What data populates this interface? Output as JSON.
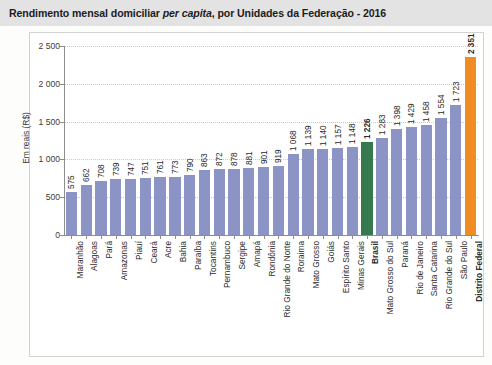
{
  "title": {
    "before_italic": "Rendimento mensal domiciliar ",
    "italic": "per capita",
    "after_italic": ", por Unidades da Federação - 2016"
  },
  "colors": {
    "bar_default": "#8b94c4",
    "bar_brasil": "#36794e",
    "bar_distrito_federal": "#ef8c24",
    "title_band": "#e3e3e3",
    "grid": "#c9c9c9",
    "axis": "#8d8d8d"
  },
  "chart_data": {
    "type": "bar",
    "title": "Rendimento mensal domiciliar per capita, por Unidades da Federação - 2016",
    "xlabel": "",
    "ylabel": "Em reais (R$)",
    "ylim": [
      0,
      2500
    ],
    "yticks": [
      0,
      500,
      1000,
      1500,
      2000,
      2500
    ],
    "ytick_labels": [
      "0",
      "500",
      "1 000",
      "1 500",
      "2 000",
      "2 500"
    ],
    "grid": "horizontal-dotted",
    "legend": "none",
    "categories": [
      "Maranhão",
      "Alagoas",
      "Pará",
      "Amazonas",
      "Piauí",
      "Ceará",
      "Acre",
      "Bahia",
      "Paraíba",
      "Tocantins",
      "Pernambuco",
      "Sergipe",
      "Amapá",
      "Rondônia",
      "Rio Grande do Norte",
      "Roraima",
      "Mato Grosso",
      "Goiás",
      "Espírito Santo",
      "Minas Gerais",
      "Brasil",
      "Mato Grosso do Sul",
      "Paraná",
      "Rio de Janeiro",
      "Santa Catarina",
      "Rio Grande do Sul",
      "São Paulo",
      "Distrito Federal"
    ],
    "values": [
      575,
      662,
      708,
      739,
      747,
      751,
      761,
      773,
      790,
      863,
      872,
      878,
      881,
      901,
      919,
      1068,
      1139,
      1140,
      1157,
      1168,
      1226,
      1283,
      1398,
      1429,
      1458,
      1554,
      1723,
      2351
    ],
    "value_labels": [
      "575",
      "662",
      "708",
      "739",
      "747",
      "751",
      "761",
      "773",
      "790",
      "863",
      "872",
      "878",
      "881",
      "901",
      "919",
      "1 068",
      "1 139",
      "1 140",
      "1 157",
      "1 148",
      "1 226",
      "1 283",
      "1 398",
      "1 429",
      "1 458",
      "1 554",
      "1 723",
      "2 351"
    ],
    "highlighted": {
      "Brasil": "#36794e",
      "Distrito Federal": "#ef8c24"
    }
  }
}
